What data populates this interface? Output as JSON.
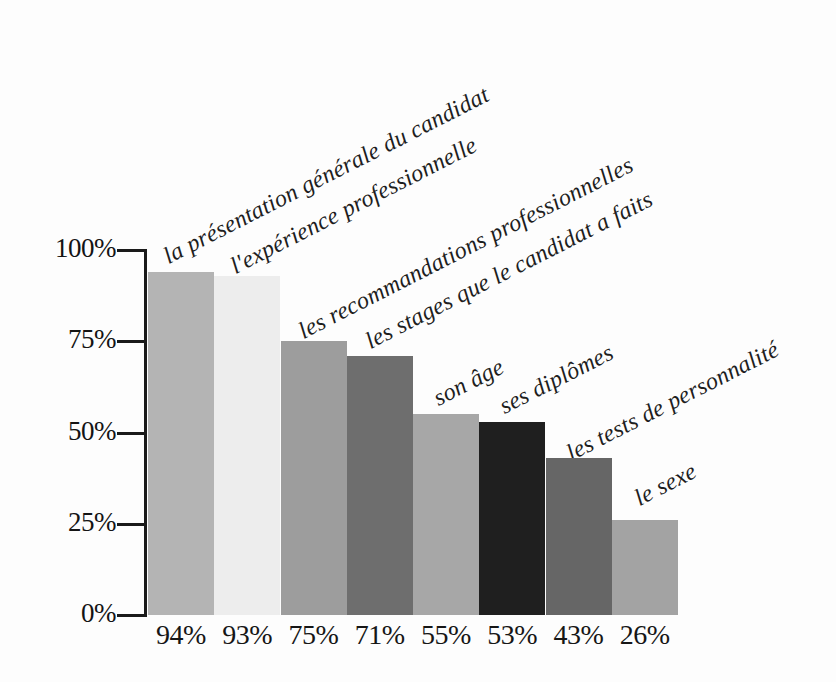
{
  "chart_data": {
    "type": "bar",
    "title": "",
    "subtitle": "",
    "xlabel": "",
    "ylabel": "",
    "ylim": [
      0,
      100
    ],
    "grid": false,
    "legend_position": "none",
    "orientation": "vertical",
    "categories": [
      "la présentation générale du candidat",
      "l'expérience professionnelle",
      "les recommandations professionnelles",
      "les stages que le candidat a faits",
      "son âge",
      "ses diplômes",
      "les tests de personnalité",
      "le sexe"
    ],
    "values": [
      94,
      93,
      75,
      71,
      55,
      53,
      43,
      26
    ],
    "value_labels": [
      "94%",
      "93%",
      "75%",
      "71%",
      "55%",
      "53%",
      "43%",
      "26%"
    ],
    "bar_colors": [
      "#b4b4b4",
      "#ededed",
      "#9d9d9d",
      "#6e6e6e",
      "#a7a7a7",
      "#1f1f1f",
      "#666666",
      "#a3a3a3"
    ],
    "yticks": [
      0,
      25,
      50,
      75,
      100
    ],
    "ytick_labels": [
      "0%",
      "25%",
      "50%",
      "75%",
      "100%"
    ]
  },
  "axis": {
    "line_color": "#1a1a1a"
  },
  "page": {
    "bleed_text": ""
  }
}
